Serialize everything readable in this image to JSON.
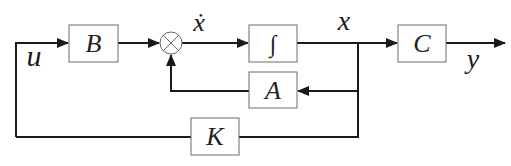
{
  "diagram": {
    "type": "state-feedback block diagram",
    "blocks": {
      "B": {
        "label": "B"
      },
      "integrator": {
        "label": "∫"
      },
      "C": {
        "label": "C"
      },
      "A": {
        "label": "A"
      },
      "K": {
        "label": "K"
      }
    },
    "summing_junction": {
      "symbol": "⊗"
    },
    "signals": {
      "u": "u",
      "x_dot": "ẋ",
      "x": "x",
      "y": "y"
    },
    "colors": {
      "line": "#1a1a1a",
      "block_border": "#6a6a6a",
      "background": "#ffffff"
    }
  }
}
